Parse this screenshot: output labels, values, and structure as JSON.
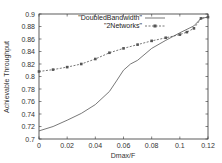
{
  "chart_data": {
    "type": "line",
    "title": "",
    "xlabel": "Dmax/F",
    "ylabel": "Achievable Throughput",
    "xlim": [
      0,
      0.12
    ],
    "ylim": [
      0.7,
      0.9
    ],
    "xticks": [
      "0",
      "0.02",
      "0.04",
      "0.06",
      "0.08",
      "0.1",
      "0.12"
    ],
    "yticks": [
      "0.7",
      "0.72",
      "0.74",
      "0.76",
      "0.78",
      "0.8",
      "0.82",
      "0.84",
      "0.86",
      "0.88",
      "0.9"
    ],
    "grid": false,
    "legend_position": "upper-left-inside",
    "series": [
      {
        "name": "\"DoubledBandwidth\"",
        "style": "solid",
        "marker": "none",
        "x": [
          0,
          0.01,
          0.02,
          0.03,
          0.04,
          0.05,
          0.055,
          0.06,
          0.065,
          0.07,
          0.08,
          0.09,
          0.1,
          0.11,
          0.115,
          0.12
        ],
        "y": [
          0.713,
          0.72,
          0.73,
          0.741,
          0.755,
          0.776,
          0.793,
          0.81,
          0.82,
          0.826,
          0.845,
          0.858,
          0.87,
          0.881,
          0.893,
          0.895
        ]
      },
      {
        "name": "\"2Networks\"",
        "style": "dashed",
        "marker": "square",
        "x": [
          0,
          0.01,
          0.02,
          0.03,
          0.04,
          0.05,
          0.06,
          0.07,
          0.08,
          0.09,
          0.1,
          0.105,
          0.11,
          0.115,
          0.12
        ],
        "y": [
          0.808,
          0.811,
          0.815,
          0.82,
          0.828,
          0.838,
          0.845,
          0.851,
          0.857,
          0.862,
          0.867,
          0.871,
          0.877,
          0.893,
          0.895
        ]
      }
    ]
  },
  "legend": {
    "items": [
      {
        "label": "\"DoubledBandwidth\""
      },
      {
        "label": "\"2Networks\""
      }
    ]
  },
  "axes": {
    "xlabel": "Dmax/F",
    "ylabel": "Achievable Throughput"
  }
}
